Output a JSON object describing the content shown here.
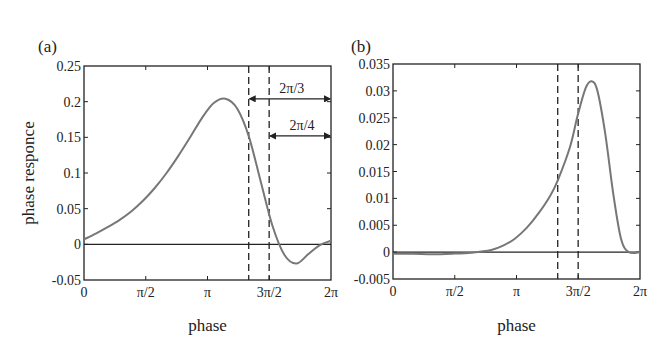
{
  "chart_data": [
    {
      "type": "line",
      "panel": "(a)",
      "title": "",
      "xlabel": "phase",
      "ylabel": "phase responce",
      "xlim": [
        0,
        6.2832
      ],
      "ylim": [
        -0.05,
        0.25
      ],
      "x_ticks": [
        "0",
        "π/2",
        "π",
        "3π/2",
        "2π"
      ],
      "y_ticks": [
        "0.25",
        "0.2",
        "0.15",
        "0.1",
        "0.05",
        "0",
        "-0.05"
      ],
      "grid": false,
      "series": [
        {
          "name": "phase response",
          "x": [
            0,
            0.3,
            0.6,
            0.9,
            1.2,
            1.5,
            1.8,
            2.1,
            2.4,
            2.7,
            3.0,
            3.3,
            3.6,
            3.9,
            4.2,
            4.5,
            4.8,
            5.1,
            5.4,
            5.7,
            6.0,
            6.2832
          ],
          "values": [
            0.007,
            0.015,
            0.024,
            0.034,
            0.046,
            0.061,
            0.079,
            0.1,
            0.124,
            0.15,
            0.177,
            0.198,
            0.204,
            0.19,
            0.15,
            0.087,
            0.025,
            -0.015,
            -0.027,
            -0.014,
            -0.001,
            0.005
          ]
        }
      ],
      "reference_lines": {
        "horizontal": [
          0
        ],
        "vertical_dashed": [
          4.19,
          4.71
        ]
      },
      "annotations": [
        {
          "text": "2π/3",
          "from": 4.19,
          "to": 6.2832,
          "y": 0.204
        },
        {
          "text": "2π/4",
          "from": 4.71,
          "to": 6.2832,
          "y": 0.152
        }
      ]
    },
    {
      "type": "line",
      "panel": "(b)",
      "title": "",
      "xlabel": "phase",
      "ylabel": "",
      "xlim": [
        0,
        6.2832
      ],
      "ylim": [
        -0.005,
        0.035
      ],
      "x_ticks": [
        "0",
        "π/2",
        "π",
        "3π/2",
        "2π"
      ],
      "y_ticks": [
        "0.035",
        "0.03",
        "0.025",
        "0.02",
        "0.015",
        "0.01",
        "0.005",
        "0",
        "-0.005"
      ],
      "grid": false,
      "series": [
        {
          "name": "phase response",
          "x": [
            0,
            0.5,
            1.0,
            1.5,
            2.0,
            2.5,
            2.8,
            3.1,
            3.4,
            3.7,
            4.0,
            4.2,
            4.5,
            4.7,
            4.9,
            5.05,
            5.2,
            5.4,
            5.6,
            5.8,
            6.0,
            6.2832
          ],
          "values": [
            -0.0003,
            -0.0003,
            -0.0004,
            -0.0003,
            -0.0001,
            0.0004,
            0.0012,
            0.0025,
            0.0045,
            0.0072,
            0.0105,
            0.0135,
            0.0195,
            0.0255,
            0.0305,
            0.0318,
            0.03,
            0.022,
            0.011,
            0.0025,
            0.0,
            0.0
          ]
        }
      ],
      "reference_lines": {
        "horizontal": [
          0
        ],
        "vertical_dashed": [
          4.19,
          4.71
        ]
      }
    }
  ],
  "panels": {
    "a": {
      "label": "(a)",
      "xlabel": "phase",
      "ylabel": "phase responce",
      "arrow1": "2π/3",
      "arrow2": "2π/4"
    },
    "b": {
      "label": "(b)",
      "xlabel": "phase"
    }
  }
}
